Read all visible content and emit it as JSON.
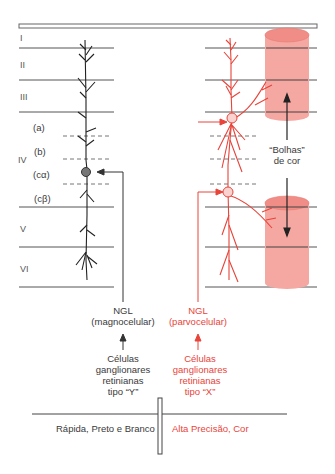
{
  "diagram": {
    "title": "",
    "colors": {
      "magno": "#333333",
      "parvo": "#e8443a",
      "blob_fill": "#f4a29c",
      "blob_top": "#f08f88",
      "layer_line": "#555555"
    },
    "layers": {
      "I": "I",
      "II": "II",
      "III": "III",
      "IV": "IV",
      "IVa": "(a)",
      "IVb": "(b)",
      "IVca": "(cα)",
      "IVcb": "(cβ)",
      "V": "V",
      "VI": "VI"
    },
    "blobs_label": {
      "line1": "“Bolhas”",
      "line2": "de cor"
    },
    "magno": {
      "ngl_line1": "NGL",
      "ngl_line2": "(magnocelular)",
      "cells_line1": "Células",
      "cells_line2": "ganglionares",
      "cells_line3": "retinianas",
      "cells_line4": "tipo “Y”",
      "property": "Rápida, Preto e Branco"
    },
    "parvo": {
      "ngl_line1": "NGL",
      "ngl_line2": "(parvocelular)",
      "cells_line1": "Células",
      "cells_line2": "ganglionares",
      "cells_line3": "retinianas",
      "cells_line4": "tipo “X”",
      "property": "Alta Precisão, Cor"
    }
  }
}
